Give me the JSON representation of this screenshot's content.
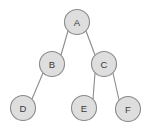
{
  "diagram": {
    "type": "binary-tree",
    "canvas": {
      "width": 149,
      "height": 131,
      "background": "#ffffff"
    },
    "style": {
      "node_fill": "#dedede",
      "node_stroke": "#8a8a8a",
      "edge_stroke": "#8c8c8c",
      "label_color": "#3a3a3a",
      "node_radius": 12.5
    },
    "nodes": [
      {
        "id": "A",
        "label": "A",
        "cx": 77,
        "cy": 22,
        "level": 0
      },
      {
        "id": "B",
        "label": "B",
        "cx": 52,
        "cy": 64,
        "level": 1
      },
      {
        "id": "C",
        "label": "C",
        "cx": 104,
        "cy": 64,
        "level": 1
      },
      {
        "id": "D",
        "label": "D",
        "cx": 23,
        "cy": 108,
        "level": 2
      },
      {
        "id": "E",
        "label": "E",
        "cx": 84,
        "cy": 108,
        "level": 2
      },
      {
        "id": "F",
        "label": "F",
        "cx": 128,
        "cy": 109,
        "level": 2
      }
    ],
    "edges": [
      {
        "from": "A",
        "to": "B",
        "x1": 68,
        "y1": 31,
        "x2": 61,
        "y2": 55
      },
      {
        "from": "A",
        "to": "C",
        "x1": 86,
        "y1": 31,
        "x2": 95,
        "y2": 55
      },
      {
        "from": "B",
        "to": "D",
        "x1": 43,
        "y1": 73,
        "x2": 32,
        "y2": 99
      },
      {
        "from": "C",
        "to": "E",
        "x1": 95,
        "y1": 73,
        "x2": 93,
        "y2": 99
      },
      {
        "from": "C",
        "to": "F",
        "x1": 113,
        "y1": 73,
        "x2": 119,
        "y2": 100
      }
    ]
  }
}
